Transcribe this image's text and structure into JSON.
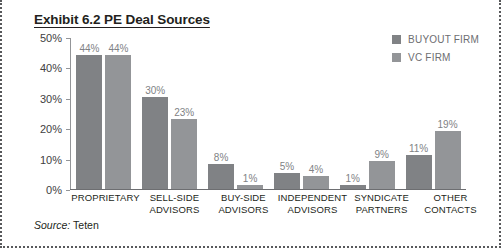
{
  "figure": {
    "title": "Exhibit 6.2 PE Deal Sources",
    "source_prefix": "Source:",
    "source_value": "Teten"
  },
  "legend": {
    "position": "top-right",
    "items": [
      {
        "label": "BUYOUT FIRM",
        "color": "#808285"
      },
      {
        "label": "VC FIRM",
        "color": "#939598"
      }
    ]
  },
  "chart_data": {
    "type": "bar",
    "title": "Exhibit 6.2 PE Deal Sources",
    "xlabel": "",
    "ylabel": "",
    "ylim": [
      0,
      50
    ],
    "ytick_labels": [
      "50%",
      "40%",
      "30%",
      "20%",
      "10%",
      "0%"
    ],
    "ytick_values": [
      50,
      40,
      30,
      20,
      10,
      0
    ],
    "grid": false,
    "legend_position": "top-right",
    "categories": [
      "PROPRIETARY",
      "SELL-SIDE ADVISORS",
      "BUY-SIDE ADVISORS",
      "INDEPENDENT ADVISORS",
      "SYNDICATE PARTNERS",
      "OTHER CONTACTS"
    ],
    "category_lines": [
      [
        "PROPRIETARY"
      ],
      [
        "SELL-SIDE",
        "ADVISORS"
      ],
      [
        "BUY-SIDE",
        "ADVISORS"
      ],
      [
        "INDEPENDENT",
        "ADVISORS"
      ],
      [
        "SYNDICATE",
        "PARTNERS"
      ],
      [
        "OTHER",
        "CONTACTS"
      ]
    ],
    "series": [
      {
        "name": "BUYOUT FIRM",
        "color": "#808285",
        "values": [
          44,
          30,
          8,
          5,
          1,
          11
        ],
        "labels": [
          "44%",
          "30%",
          "8%",
          "5%",
          "1%",
          "11%"
        ]
      },
      {
        "name": "VC FIRM",
        "color": "#939598",
        "values": [
          44,
          23,
          1,
          4,
          9,
          19
        ],
        "labels": [
          "44%",
          "23%",
          "1%",
          "4%",
          "9%",
          "19%"
        ]
      }
    ]
  }
}
